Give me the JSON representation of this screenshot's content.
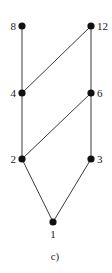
{
  "diagram": {
    "type": "hasse-diagram",
    "caption": "c)",
    "nodes": [
      {
        "id": "1",
        "label": "1",
        "x": 53,
        "y": 222,
        "label_pos": "below"
      },
      {
        "id": "2",
        "label": "2",
        "x": 22,
        "y": 159,
        "label_pos": "left"
      },
      {
        "id": "3",
        "label": "3",
        "x": 91,
        "y": 159,
        "label_pos": "right"
      },
      {
        "id": "4",
        "label": "4",
        "x": 22,
        "y": 93,
        "label_pos": "left"
      },
      {
        "id": "6",
        "label": "6",
        "x": 91,
        "y": 93,
        "label_pos": "right"
      },
      {
        "id": "8",
        "label": "8",
        "x": 22,
        "y": 26,
        "label_pos": "left"
      },
      {
        "id": "12",
        "label": "12",
        "x": 91,
        "y": 26,
        "label_pos": "right"
      }
    ],
    "edges": [
      {
        "from": "1",
        "to": "2"
      },
      {
        "from": "1",
        "to": "3"
      },
      {
        "from": "2",
        "to": "4"
      },
      {
        "from": "2",
        "to": "6"
      },
      {
        "from": "3",
        "to": "6"
      },
      {
        "from": "4",
        "to": "8"
      },
      {
        "from": "4",
        "to": "12"
      },
      {
        "from": "6",
        "to": "12"
      }
    ],
    "colors": {
      "node": "#111111",
      "edge": "#3a3a3a",
      "background": "#ffffff"
    }
  }
}
